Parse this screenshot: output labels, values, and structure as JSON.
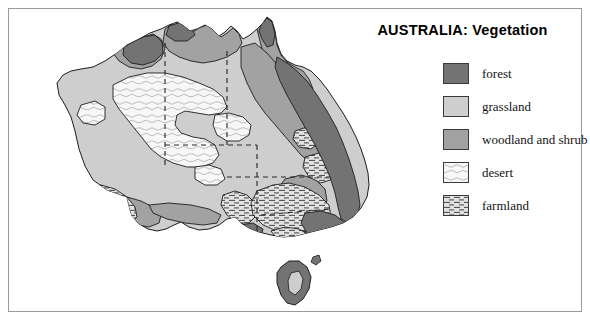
{
  "figure": {
    "title": "AUSTRALIA:  Vegetation",
    "frame_color": "#9a9a9a",
    "background": "#ffffff"
  },
  "legend": {
    "name": "map-legend",
    "items": [
      {
        "key": "forest",
        "label": "forest",
        "color": "#737373",
        "pattern": "solid"
      },
      {
        "key": "grassland",
        "label": "grassland",
        "color": "#cecece",
        "pattern": "solid"
      },
      {
        "key": "woodland",
        "label": "woodland and shrub",
        "color": "#a2a2a2",
        "pattern": "solid"
      },
      {
        "key": "desert",
        "label": "desert",
        "color": "#f2f2f2",
        "pattern": "squiggle"
      },
      {
        "key": "farmland",
        "label": "farmland",
        "color": "#dedede",
        "pattern": "horizontal-hatch"
      }
    ]
  },
  "map": {
    "name": "australia-vegetation-map",
    "continent": "Australia",
    "features": [
      "mainland-coastline",
      "tasmania",
      "state-borders-dashed",
      "cape-york-woodland",
      "arnhem-land-woodland",
      "kimberley-woodland",
      "great-dividing-range-forest",
      "central-desert",
      "southwest-farmland",
      "murray-basin-farmland",
      "eyre-peninsula-farmland"
    ],
    "outline_color": "#1d1d1d",
    "border_style": "dashed"
  }
}
